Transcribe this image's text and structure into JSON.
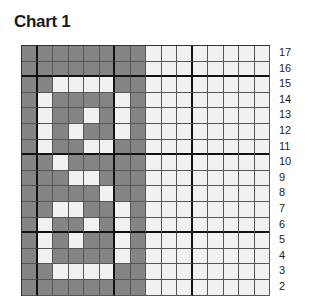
{
  "chart_data": {
    "type": "heatmap",
    "title": "Chart 1",
    "columns": 16,
    "row_labels": [
      "17",
      "16",
      "15",
      "14",
      "13",
      "12",
      "11",
      "10",
      "9",
      "8",
      "7",
      "6",
      "5",
      "4",
      "3",
      "2"
    ],
    "legend": {
      "D": "dark (contrast color)",
      "L": "light (main color)"
    },
    "colors": {
      "D": "#858585",
      "L": "#f1f1f1"
    },
    "rows": [
      "DDDDDDDDLLLLLLLL",
      "DDDDDDDDLLLLLLLL",
      "DDLLLLDDLLLLLLLL",
      "DLDDDDLDLLLLLLLL",
      "DLDDLDLDLLLLLLLL",
      "DLDLDDLDLLLLLLLL",
      "DLDDLLDDLLLLLLLL",
      "DDLDDDDDLLLLLLLL",
      "DDDLLDDDLLLLLLLL",
      "DDDDDLDDLLLLLLLL",
      "DDLLDDLDLLLLLLLL",
      "DLDDLDLDLLLLLLLL",
      "DLDLDDLDLLLLLLLL",
      "DLDDDDLDLLLLLLLL",
      "DDLLLLDDLLLLLLLL",
      "DDDDDDDDLLLLLLLL"
    ],
    "thick_col_after": [
      1,
      6,
      11
    ],
    "thick_row_after_label": [
      "16",
      "11",
      "6"
    ]
  }
}
